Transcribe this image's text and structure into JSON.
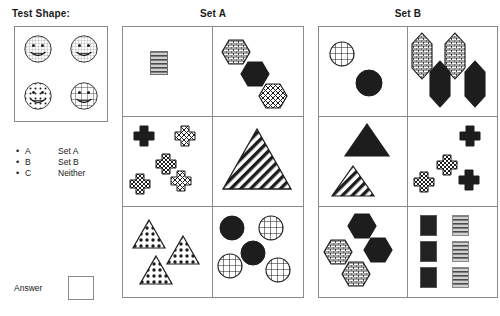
{
  "headings": {
    "test_shape": "Test Shape:",
    "set_a": "Set A",
    "set_b": "Set B"
  },
  "legend": {
    "rows": [
      {
        "bullet": "•",
        "key": "A",
        "value": "Set A"
      },
      {
        "bullet": "•",
        "key": "B",
        "value": "Set B"
      },
      {
        "bullet": "•",
        "key": "C",
        "value": "Neither"
      }
    ]
  },
  "answer": {
    "label": "Answer",
    "value": ""
  },
  "test_shape": {
    "items": [
      {
        "name": "smiley-face-hatched",
        "fill": "hatch-fine"
      },
      {
        "name": "smiley-face-hatched",
        "fill": "hatch-fine"
      },
      {
        "name": "smiley-face-dotted",
        "fill": "dots"
      },
      {
        "name": "smiley-face-grid",
        "fill": "grid"
      }
    ]
  },
  "set_a": {
    "cells": [
      {
        "id": "a-r1c1",
        "shapes": [
          {
            "type": "rectangle",
            "fill": "hlines",
            "count": 1
          }
        ]
      },
      {
        "id": "a-r1c2",
        "shapes": [
          {
            "type": "hexagon",
            "fill": "brick"
          },
          {
            "type": "hexagon",
            "fill": "black"
          },
          {
            "type": "hexagon",
            "fill": "crosshatch"
          }
        ]
      },
      {
        "id": "a-r2c1",
        "shapes": [
          {
            "type": "cross",
            "fill": "black"
          },
          {
            "type": "cross",
            "fill": "outline"
          },
          {
            "type": "cross",
            "fill": "checker"
          },
          {
            "type": "cross",
            "fill": "checker"
          },
          {
            "type": "cross",
            "fill": "crosshatch"
          }
        ]
      },
      {
        "id": "a-r2c2",
        "shapes": [
          {
            "type": "triangle",
            "fill": "diagonal-stripes"
          }
        ]
      },
      {
        "id": "a-r3c1",
        "shapes": [
          {
            "type": "triangle",
            "fill": "dots"
          },
          {
            "type": "triangle",
            "fill": "dots"
          },
          {
            "type": "triangle",
            "fill": "dots"
          }
        ]
      },
      {
        "id": "a-r3c2",
        "shapes": [
          {
            "type": "circle",
            "fill": "black"
          },
          {
            "type": "circle",
            "fill": "grid"
          },
          {
            "type": "circle",
            "fill": "black"
          },
          {
            "type": "circle",
            "fill": "grid"
          },
          {
            "type": "circle",
            "fill": "grid"
          }
        ]
      }
    ]
  },
  "set_b": {
    "cells": [
      {
        "id": "b-r1c1",
        "shapes": [
          {
            "type": "circle",
            "fill": "grid"
          },
          {
            "type": "circle",
            "fill": "black"
          }
        ]
      },
      {
        "id": "b-r1c2",
        "shapes": [
          {
            "type": "tall-hexagon",
            "fill": "brick"
          },
          {
            "type": "tall-hexagon",
            "fill": "brick"
          },
          {
            "type": "tall-hexagon",
            "fill": "black"
          },
          {
            "type": "tall-hexagon",
            "fill": "black"
          }
        ]
      },
      {
        "id": "b-r2c1",
        "shapes": [
          {
            "type": "triangle",
            "fill": "black"
          },
          {
            "type": "triangle",
            "fill": "diagonal-stripes"
          }
        ]
      },
      {
        "id": "b-r2c2",
        "shapes": [
          {
            "type": "cross",
            "fill": "black"
          },
          {
            "type": "cross",
            "fill": "checker"
          },
          {
            "type": "cross",
            "fill": "checker"
          },
          {
            "type": "cross",
            "fill": "black"
          }
        ]
      },
      {
        "id": "b-r3c1",
        "shapes": [
          {
            "type": "hexagon",
            "fill": "black"
          },
          {
            "type": "hexagon",
            "fill": "brick"
          },
          {
            "type": "hexagon",
            "fill": "black"
          },
          {
            "type": "hexagon",
            "fill": "brick"
          }
        ]
      },
      {
        "id": "b-r3c2",
        "shapes": [
          {
            "type": "rectangle",
            "fill": "black"
          },
          {
            "type": "rectangle",
            "fill": "hlines"
          },
          {
            "type": "rectangle",
            "fill": "black"
          },
          {
            "type": "rectangle",
            "fill": "hlines"
          },
          {
            "type": "rectangle",
            "fill": "black"
          },
          {
            "type": "rectangle",
            "fill": "hlines"
          }
        ]
      }
    ]
  },
  "colors": {
    "ink": "#1a1a1a",
    "border": "#8a8a8a",
    "fill_black": "#1d1d1d",
    "fill_gray": "#7d7d7d",
    "background": "#ffffff"
  }
}
